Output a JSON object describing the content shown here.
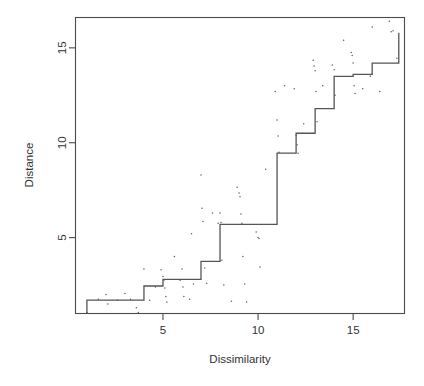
{
  "figure": {
    "background": "#ffffff",
    "width": 424,
    "height": 386
  },
  "chart_data": {
    "type": "line",
    "title": "",
    "xlabel": "Dissimilarity",
    "ylabel": "Distance",
    "xlim": [
      0.4,
      17.7
    ],
    "ylim": [
      1.0,
      16.6
    ],
    "xticks": [
      5,
      10,
      15
    ],
    "yticks": [
      5,
      10,
      15
    ],
    "xtick_labels": [
      "5",
      "10",
      "15"
    ],
    "ytick_labels": [
      "5",
      "10",
      "15"
    ],
    "grid": false,
    "legend": null,
    "box": true,
    "line_color": "#555555",
    "point_color": "#555555",
    "series": [
      {
        "name": "Monotone step fit",
        "type": "step",
        "drawstyle": "steps-post",
        "x": [
          1,
          2,
          3,
          4,
          5,
          6,
          7,
          8,
          9,
          10,
          11,
          12,
          13,
          14,
          15,
          16,
          17,
          17.4
        ],
        "y": [
          1.7,
          1.7,
          1.7,
          2.45,
          2.8,
          2.8,
          3.75,
          5.7,
          5.7,
          5.7,
          9.45,
          10.5,
          11.8,
          13.5,
          13.6,
          14.2,
          14.2,
          15.8
        ],
        "start_drop": {
          "x": 1,
          "y_from": 1.7,
          "y_to": 1.0
        }
      },
      {
        "name": "Observed dissimilarity vs distance",
        "type": "scatter",
        "marker": "point",
        "points": [
          [
            1.0,
            1.05
          ],
          [
            1.6,
            1.75
          ],
          [
            2.0,
            2.0
          ],
          [
            2.1,
            1.5
          ],
          [
            2.6,
            1.7
          ],
          [
            3.0,
            2.05
          ],
          [
            3.3,
            1.75
          ],
          [
            3.6,
            1.3
          ],
          [
            3.7,
            1.05
          ],
          [
            4.0,
            3.35
          ],
          [
            4.3,
            1.7
          ],
          [
            4.6,
            2.4
          ],
          [
            4.9,
            3.3
          ],
          [
            5.0,
            2.95
          ],
          [
            5.05,
            2.75
          ],
          [
            5.1,
            2.35
          ],
          [
            5.15,
            1.9
          ],
          [
            5.2,
            1.6
          ],
          [
            5.6,
            4.0
          ],
          [
            5.9,
            2.75
          ],
          [
            6.0,
            3.35
          ],
          [
            6.05,
            2.4
          ],
          [
            6.1,
            1.9
          ],
          [
            6.4,
            1.75
          ],
          [
            6.5,
            5.2
          ],
          [
            6.6,
            2.55
          ],
          [
            7.0,
            8.3
          ],
          [
            7.05,
            6.55
          ],
          [
            7.1,
            5.85
          ],
          [
            7.2,
            3.4
          ],
          [
            7.3,
            2.6
          ],
          [
            7.6,
            6.3
          ],
          [
            7.9,
            5.75
          ],
          [
            8.0,
            6.3
          ],
          [
            8.05,
            5.8
          ],
          [
            8.1,
            3.8
          ],
          [
            8.2,
            2.5
          ],
          [
            8.6,
            1.65
          ],
          [
            8.9,
            7.65
          ],
          [
            9.0,
            7.35
          ],
          [
            9.05,
            7.15
          ],
          [
            9.1,
            6.25
          ],
          [
            9.15,
            5.75
          ],
          [
            9.2,
            4.0
          ],
          [
            9.3,
            2.55
          ],
          [
            9.4,
            1.6
          ],
          [
            9.9,
            5.3
          ],
          [
            10.0,
            5.0
          ],
          [
            10.05,
            4.95
          ],
          [
            10.1,
            3.45
          ],
          [
            10.4,
            8.6
          ],
          [
            10.9,
            12.7
          ],
          [
            11.0,
            11.2
          ],
          [
            11.05,
            10.35
          ],
          [
            11.1,
            9.5
          ],
          [
            11.4,
            13.0
          ],
          [
            11.9,
            12.85
          ],
          [
            12.0,
            10.4
          ],
          [
            12.05,
            9.9
          ],
          [
            12.1,
            9.45
          ],
          [
            12.4,
            11.0
          ],
          [
            12.9,
            14.35
          ],
          [
            12.95,
            14.05
          ],
          [
            13.0,
            13.8
          ],
          [
            13.05,
            12.7
          ],
          [
            13.1,
            11.1
          ],
          [
            13.4,
            13.0
          ],
          [
            13.9,
            14.1
          ],
          [
            14.0,
            13.85
          ],
          [
            14.05,
            12.5
          ],
          [
            14.5,
            15.4
          ],
          [
            14.9,
            14.75
          ],
          [
            14.95,
            14.6
          ],
          [
            15.0,
            14.2
          ],
          [
            15.05,
            13.0
          ],
          [
            15.1,
            12.6
          ],
          [
            15.5,
            12.85
          ],
          [
            15.9,
            13.5
          ],
          [
            16.0,
            16.1
          ],
          [
            16.4,
            12.7
          ],
          [
            16.9,
            16.4
          ],
          [
            17.0,
            15.85
          ],
          [
            17.1,
            15.9
          ],
          [
            17.3,
            14.45
          ]
        ]
      }
    ]
  },
  "axes": {
    "x_axis_name": "Dissimilarity",
    "y_axis_name": "Distance"
  }
}
